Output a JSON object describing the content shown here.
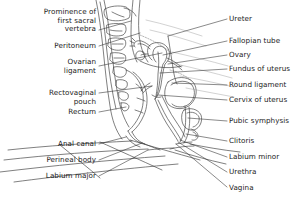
{
  "figure": {
    "background_color": "#ffffff",
    "ink_color": "#3a3a3a",
    "text_color": "#1a1a1a",
    "width": 293,
    "height": 199
  },
  "labels_left": [
    {
      "id": "prominence-of-first-sacral-vertebra",
      "lines": [
        "Prominence of",
        "first sacral",
        "vertebra"
      ],
      "text": "Prominence of first sacral vertebra",
      "text_right_x": 96,
      "text_top_y": 8,
      "leader_start": [
        99,
        30
      ],
      "leader_end": [
        131,
        21
      ]
    },
    {
      "id": "peritoneum",
      "lines": [
        "Peritoneum"
      ],
      "text": "Peritoneum",
      "text_right_x": 96,
      "text_top_y": 42,
      "leader_start": [
        99,
        46
      ],
      "leader_end": [
        140,
        33
      ]
    },
    {
      "id": "ovarian-ligament",
      "lines": [
        "Ovarian",
        "ligament"
      ],
      "text": "Ovarian ligament",
      "text_right_x": 96,
      "text_top_y": 58,
      "leader_start": [
        99,
        66
      ],
      "leader_end": [
        162,
        53
      ]
    },
    {
      "id": "rectovaginal-pouch",
      "lines": [
        "Rectovaginal",
        "pouch"
      ],
      "text": "Rectovaginal pouch",
      "text_right_x": 96,
      "text_top_y": 89,
      "leader_start": [
        99,
        93
      ],
      "leader_end": [
        152,
        86
      ]
    },
    {
      "id": "rectum",
      "lines": [
        "Rectum"
      ],
      "text": "Rectum",
      "text_right_x": 96,
      "text_top_y": 108,
      "leader_start": [
        99,
        112
      ],
      "leader_end": [
        126,
        107
      ]
    },
    {
      "id": "anal-canal",
      "lines": [
        "Anal canal"
      ],
      "text": "Anal canal",
      "text_right_x": 96,
      "text_top_y": 140,
      "leader_start": [
        99,
        144
      ],
      "leader_end": [
        126,
        137
      ]
    },
    {
      "id": "perineal-body",
      "lines": [
        "Perineal body"
      ],
      "text": "Perineal body",
      "text_right_x": 96,
      "text_top_y": 156,
      "leader_start": [
        99,
        160
      ],
      "leader_end": [
        142,
        143
      ]
    },
    {
      "id": "labium-major",
      "lines": [
        "Labium major"
      ],
      "text": "Labium major",
      "text_right_x": 96,
      "text_top_y": 172,
      "leader_start": [
        99,
        176
      ],
      "leader_end": [
        148,
        150
      ]
    }
  ],
  "labels_right": [
    {
      "id": "ureter",
      "lines": [
        "Ureter"
      ],
      "text": "Ureter",
      "text_left_x": 229,
      "text_top_y": 15,
      "leader_start": [
        227,
        19
      ],
      "leader_end": [
        168,
        36
      ]
    },
    {
      "id": "fallopian-tube",
      "lines": [
        "Fallopian tube"
      ],
      "text": "Fallopian tube",
      "text_left_x": 229,
      "text_top_y": 37,
      "leader_start": [
        227,
        41
      ],
      "leader_end": [
        163,
        55
      ]
    },
    {
      "id": "ovary",
      "lines": [
        "Ovary"
      ],
      "text": "Ovary",
      "text_left_x": 229,
      "text_top_y": 51,
      "leader_start": [
        227,
        55
      ],
      "leader_end": [
        168,
        64
      ]
    },
    {
      "id": "fundus-of-uterus",
      "lines": [
        "Fundus of uterus"
      ],
      "text": "Fundus of uterus",
      "text_left_x": 229,
      "text_top_y": 65,
      "leader_start": [
        227,
        69
      ],
      "leader_end": [
        160,
        73
      ]
    },
    {
      "id": "round-ligament",
      "lines": [
        "Round ligament"
      ],
      "text": "Round ligament",
      "text_left_x": 229,
      "text_top_y": 81,
      "leader_start": [
        227,
        85
      ],
      "leader_end": [
        172,
        83
      ]
    },
    {
      "id": "cervix-of-uterus",
      "lines": [
        "Cervix of uterus"
      ],
      "text": "Cervix of uterus",
      "text_left_x": 229,
      "text_top_y": 96,
      "leader_start": [
        227,
        100
      ],
      "leader_end": [
        158,
        95
      ]
    },
    {
      "id": "pubic-symphysis",
      "lines": [
        "Pubic symphysis"
      ],
      "text": "Pubic symphysis",
      "text_left_x": 229,
      "text_top_y": 117,
      "leader_start": [
        227,
        121
      ],
      "leader_end": [
        188,
        118
      ]
    },
    {
      "id": "clitoris",
      "lines": [
        "Clitoris"
      ],
      "text": "Clitoris",
      "text_left_x": 229,
      "text_top_y": 137,
      "leader_start": [
        227,
        141
      ],
      "leader_end": [
        186,
        134
      ]
    },
    {
      "id": "labium-minor",
      "lines": [
        "Labium minor"
      ],
      "text": "Labium minor",
      "text_left_x": 229,
      "text_top_y": 153,
      "leader_start": [
        227,
        157
      ],
      "leader_end": [
        180,
        140
      ]
    },
    {
      "id": "urethra",
      "lines": [
        "Urethra"
      ],
      "text": "Urethra",
      "text_left_x": 229,
      "text_top_y": 168,
      "leader_start": [
        227,
        172
      ],
      "leader_end": [
        178,
        142
      ]
    },
    {
      "id": "vagina",
      "lines": [
        "Vagina"
      ],
      "text": "Vagina",
      "text_left_x": 229,
      "text_top_y": 184,
      "leader_start": [
        227,
        187
      ],
      "leader_end": [
        176,
        144
      ]
    }
  ],
  "illustration": {
    "description": "Line drawing: sagittal (midline) section through the female pelvis showing sacrum, rectum, uterus, bladder, vagina and perineum",
    "style": "fine black line art, no fill"
  }
}
